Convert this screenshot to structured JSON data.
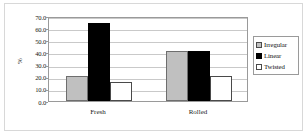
{
  "chart_data": {
    "type": "bar",
    "title": "",
    "xlabel": "",
    "ylabel": "%",
    "categories": [
      "Fresh",
      "Rolled"
    ],
    "series": [
      {
        "name": "Irregular",
        "values": [
          21.0,
          41.5
        ],
        "color": "#C0C0C0"
      },
      {
        "name": "Linear",
        "values": [
          64.0,
          41.5
        ],
        "color": "#000000"
      },
      {
        "name": "Twisted",
        "values": [
          16.0,
          21.0
        ],
        "color": "#FFFFFF"
      }
    ],
    "ylim": [
      0.0,
      70.0
    ],
    "ytick_step": 10.0,
    "ytick_labels": [
      "70.0",
      "60.0",
      "50.0",
      "40.0",
      "30.0",
      "20.0",
      "10.0",
      "0.0"
    ],
    "ytick_values": [
      70.0,
      60.0,
      50.0,
      40.0,
      30.0,
      20.0,
      10.0,
      0.0
    ],
    "grid": true,
    "grid_axis": "y",
    "legend_position": "right"
  },
  "legend": {
    "items": [
      {
        "label": "Irregular"
      },
      {
        "label": "Linear"
      },
      {
        "label": "Twisted"
      }
    ]
  },
  "axes": {
    "y_title": "%"
  }
}
